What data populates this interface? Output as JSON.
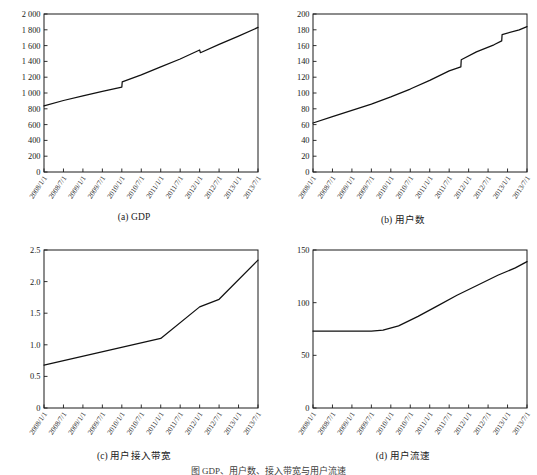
{
  "figure": {
    "footer_caption": "图    GDP、用户数、接入带宽与用户流速"
  },
  "panels": [
    {
      "id": "a",
      "caption": "(a) GDP",
      "chart_data": {
        "type": "line",
        "title": "(a) GDP",
        "xlabel": "",
        "ylabel": "",
        "ylim": [
          0,
          2000
        ],
        "yticks": [
          0,
          200,
          400,
          600,
          800,
          1000,
          1200,
          1400,
          1600,
          1800,
          2000
        ],
        "ytick_labels": [
          "0",
          "200",
          "400",
          "600",
          "800",
          "1 000",
          "1 200",
          "1 400",
          "1 600",
          "1 800",
          "2 000"
        ],
        "grid": false,
        "legend": "none",
        "categories": [
          "2008/1/1",
          "2008/7/1",
          "2009/1/1",
          "2009/7/1",
          "2010/1/1",
          "2010/7/1",
          "2011/1/1",
          "2011/7/1",
          "2012/1/1",
          "2012/7/1",
          "2013/1/1",
          "2013/7/1"
        ],
        "series": [
          {
            "name": "GDP",
            "values": [
              836,
              905,
              965,
              1020,
              1075,
              1140,
              1230,
              1330,
              1430,
              1545,
              1510,
              1615,
              1720,
              1830
            ]
          }
        ],
        "x_positions": [
          0,
          1,
          2,
          3,
          4,
          4.02,
          5,
          6,
          7,
          8,
          8.04,
          9,
          10,
          11
        ]
      }
    },
    {
      "id": "b",
      "caption": "(b) 用户数",
      "chart_data": {
        "type": "line",
        "title": "(b) 用户数",
        "xlabel": "",
        "ylabel": "",
        "ylim": [
          0,
          200
        ],
        "yticks": [
          0,
          20,
          40,
          60,
          80,
          100,
          120,
          140,
          160,
          180,
          200
        ],
        "ytick_labels": [
          "0",
          "20",
          "40",
          "60",
          "80",
          "100",
          "120",
          "140",
          "160",
          "180",
          "200"
        ],
        "grid": false,
        "legend": "none",
        "categories": [
          "2008/1/1",
          "2008/7/1",
          "2009/1/1",
          "2009/7/1",
          "2010/1/1",
          "2010/7/1",
          "2011/1/1",
          "2011/7/1",
          "2012/1/1",
          "2012/7/1",
          "2013/1/1",
          "2013/7/1"
        ],
        "series": [
          {
            "name": "用户数",
            "values": [
              62,
              70,
              78,
              86,
              95,
              105,
              116,
              128,
              133,
              142,
              152,
              161,
              166,
              174,
              180,
              184
            ]
          }
        ],
        "x_positions": [
          0,
          1,
          2,
          3,
          4,
          5,
          6,
          7,
          7.6,
          7.62,
          8.4,
          9.3,
          9.7,
          9.72,
          10.6,
          11
        ]
      }
    },
    {
      "id": "c",
      "caption": "(c) 用户接入带宽",
      "chart_data": {
        "type": "line",
        "title": "(c) 用户接入带宽",
        "xlabel": "",
        "ylabel": "",
        "ylim": [
          0,
          2.5
        ],
        "yticks": [
          0,
          0.5,
          1.0,
          1.5,
          2.0,
          2.5
        ],
        "ytick_labels": [
          "0",
          "0.5",
          "1.0",
          "1.5",
          "2.0",
          "2.5"
        ],
        "grid": false,
        "legend": "none",
        "categories": [
          "2008/1/1",
          "2008/7/1",
          "2009/1/1",
          "2009/7/1",
          "2010/1/1",
          "2010/7/1",
          "2011/1/1",
          "2011/7/1",
          "2012/1/1",
          "2012/7/1",
          "2013/1/1",
          "2013/7/1"
        ],
        "series": [
          {
            "name": "用户接入带宽",
            "values": [
              0.68,
              1.1,
              1.6,
              1.72,
              2.34
            ]
          }
        ],
        "x_positions": [
          0,
          6,
          8,
          9,
          11
        ]
      }
    },
    {
      "id": "d",
      "caption": "(d) 用户流速",
      "chart_data": {
        "type": "line",
        "title": "(d) 用户流速",
        "xlabel": "",
        "ylabel": "",
        "ylim": [
          0,
          150
        ],
        "yticks": [
          0,
          50,
          100,
          150
        ],
        "ytick_labels": [
          "0",
          "50",
          "100",
          "150"
        ],
        "grid": false,
        "legend": "none",
        "categories": [
          "2008/1/1",
          "2008/7/1",
          "2009/1/1",
          "2009/7/1",
          "2010/1/1",
          "2010/7/1",
          "2011/1/1",
          "2011/7/1",
          "2012/1/1",
          "2012/7/1",
          "2013/1/1",
          "2013/7/1"
        ],
        "series": [
          {
            "name": "用户流速",
            "values": [
              73,
              73,
              73,
              73,
              74,
              78,
              87,
              97,
              107,
              116,
              126,
              133,
              139
            ]
          }
        ],
        "x_positions": [
          0,
          1,
          2,
          3,
          3.6,
          4.4,
          5.4,
          6.4,
          7.4,
          8.4,
          9.5,
          10.4,
          11
        ]
      }
    }
  ]
}
